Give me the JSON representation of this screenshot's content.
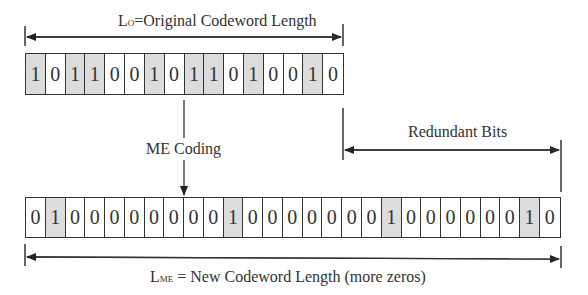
{
  "top_dimension": {
    "label_main": "L",
    "label_sub": "O",
    "label_rest": "=Original Codeword Length"
  },
  "original_codeword": {
    "bits": [
      1,
      0,
      1,
      1,
      0,
      0,
      1,
      0,
      1,
      1,
      0,
      1,
      0,
      0,
      1,
      0
    ],
    "length": 16
  },
  "process": {
    "label": "ME Coding"
  },
  "redundant": {
    "label": "Redundant Bits"
  },
  "new_codeword": {
    "bits": [
      0,
      1,
      0,
      0,
      0,
      0,
      0,
      0,
      0,
      0,
      1,
      0,
      0,
      0,
      0,
      0,
      0,
      0,
      1,
      0,
      0,
      0,
      0,
      0,
      0,
      1,
      0
    ],
    "length": 27
  },
  "bottom_dimension": {
    "label_main": "L",
    "label_sub": "ME",
    "label_rest": " = New Codeword Length (more zeros)"
  },
  "colors": {
    "one_fill": "#dcdcdc",
    "zero_fill": "#ffffff",
    "stroke": "#333333"
  }
}
